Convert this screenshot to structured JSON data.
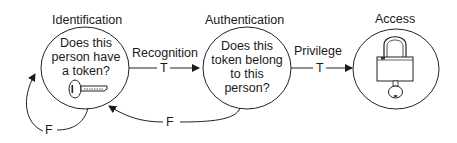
{
  "diagram": {
    "nodes": [
      {
        "id": "identification",
        "title": "Identification",
        "question": "Does this\nperson have\na token?",
        "icon": "key-icon"
      },
      {
        "id": "authentication",
        "title": "Authentication",
        "question": "Does this\ntoken belong\nto this\nperson?"
      },
      {
        "id": "access",
        "title": "Access",
        "icon": "padlock-with-key-icon"
      }
    ],
    "edges": [
      {
        "from": "identification",
        "to": "authentication",
        "label": "Recognition",
        "condition": "T"
      },
      {
        "from": "authentication",
        "to": "access",
        "label": "Privilege",
        "condition": "T"
      },
      {
        "from": "identification",
        "to": "identification",
        "condition": "F"
      },
      {
        "from": "authentication",
        "to": "identification",
        "condition": "F"
      }
    ]
  }
}
